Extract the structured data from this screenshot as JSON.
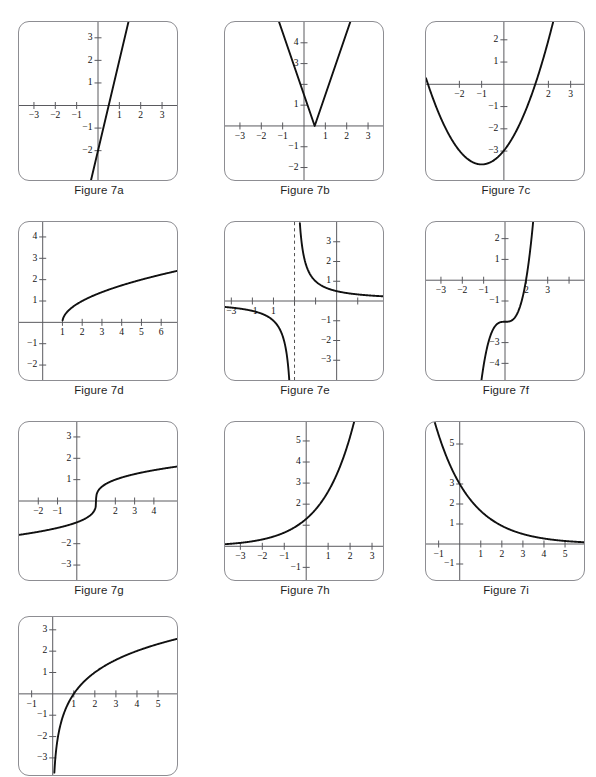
{
  "page": {
    "header_fragment": "",
    "figure_count": 10
  },
  "figures": [
    {
      "id": "7a",
      "caption": "Figure 7a",
      "row": 0,
      "col": 0,
      "chart_data": {
        "type": "line",
        "title": "Figure 7a",
        "xlabel": "",
        "ylabel": "",
        "grid": false,
        "legend": "none",
        "xlim": [
          -3.7,
          3.7
        ],
        "ylim": [
          -3.3,
          3.7
        ],
        "xticks": [
          -3,
          -2,
          -1,
          1,
          2,
          3
        ],
        "yticks": [
          -2,
          -1,
          1,
          2,
          3
        ],
        "xtick_labels": [
          "-3",
          "-2",
          "-1",
          "1",
          "2",
          "3"
        ],
        "ytick_labels": [
          "-2",
          "-1",
          "1",
          "2",
          "3"
        ],
        "description": "Steep increasing straight line, y-intercept -2, x-intercept 0.5",
        "series": [
          {
            "name": "y = 4x - 2",
            "x": [
              -0.35,
              1.45
            ],
            "y": [
              -3.4,
              3.8
            ]
          }
        ]
      }
    },
    {
      "id": "7b",
      "caption": "Figure 7b",
      "row": 0,
      "col": 1,
      "chart_data": {
        "type": "line",
        "title": "Figure 7b",
        "xlabel": "",
        "ylabel": "",
        "grid": false,
        "legend": "none",
        "xlim": [
          -3.7,
          3.7
        ],
        "ylim": [
          -2.6,
          5.0
        ],
        "xticks": [
          -3,
          -2,
          -1,
          1,
          2,
          3
        ],
        "yticks": [
          -2,
          -1,
          1,
          2,
          3,
          4
        ],
        "xtick_labels": [
          "-3",
          "-2",
          "-1",
          "1",
          "2",
          "3"
        ],
        "ytick_labels": [
          "-2",
          "-1",
          "1",
          "3",
          "4"
        ],
        "description": "V-shaped absolute value graph with vertex at (0.5, 0), slopes -3 and +3",
        "series": [
          {
            "name": "y = 3|x - 0.5|",
            "x": [
              -1.25,
              0.5,
              2.25
            ],
            "y": [
              5.25,
              0,
              5.25
            ]
          }
        ]
      }
    },
    {
      "id": "7c",
      "caption": "Figure 7c",
      "row": 0,
      "col": 2,
      "chart_data": {
        "type": "line",
        "title": "Figure 7c",
        "xlabel": "",
        "ylabel": "",
        "grid": false,
        "legend": "none",
        "xlim": [
          -3.5,
          3.6
        ],
        "ylim": [
          -4.3,
          2.8
        ],
        "xticks": [
          -2,
          -1,
          2,
          3
        ],
        "yticks": [
          -3,
          -2,
          -1,
          1,
          2
        ],
        "xtick_labels": [
          "-2",
          "-1",
          "2",
          "3"
        ],
        "ytick_labels": [
          "-3",
          "-2",
          "-1",
          "1",
          "2"
        ],
        "description": "Upward parabola, vertex near (-1, -3.6), y-intercept -3, roots near -2.9 and 0.9",
        "series": [
          {
            "name": "y = 0.6(x + 1)^2 - 3.6",
            "equation": "parabola",
            "vertex": [
              -1,
              -3.6
            ],
            "a": 0.62
          }
        ]
      }
    },
    {
      "id": "7d",
      "caption": "Figure 7d",
      "row": 1,
      "col": 0,
      "chart_data": {
        "type": "line",
        "title": "Figure 7d",
        "xlabel": "",
        "ylabel": "",
        "grid": false,
        "legend": "none",
        "xlim": [
          -1.2,
          6.8
        ],
        "ylim": [
          -2.7,
          4.7
        ],
        "xticks": [
          1,
          2,
          3,
          4,
          5,
          6
        ],
        "yticks": [
          -2,
          -1,
          1,
          2,
          3,
          4
        ],
        "xtick_labels": [
          "1",
          "2",
          "3",
          "4",
          "5",
          "6"
        ],
        "ytick_labels": [
          "-2",
          "-1",
          "1",
          "2",
          "3",
          "4"
        ],
        "description": "Square root curve beginning at (1, 0), rising to about 2.3 at x = 6.4",
        "series": [
          {
            "name": "y = sqrt(x - 1)",
            "equation": "sqrt",
            "x0": 1,
            "k": 1.0
          }
        ]
      }
    },
    {
      "id": "7e",
      "caption": "Figure 7e",
      "row": 1,
      "col": 1,
      "chart_data": {
        "type": "line",
        "title": "Figure 7e",
        "xlabel": "",
        "ylabel": "",
        "grid": false,
        "legend": "none",
        "xlim": [
          -5.3,
          2.2
        ],
        "ylim": [
          -4.0,
          4.0
        ],
        "xticks": [
          -5,
          -4,
          -3,
          -2,
          -1,
          1
        ],
        "yticks": [
          -3,
          -2,
          -1,
          1,
          2,
          3
        ],
        "xtick_labels": [
          "-3",
          "-1",
          "1"
        ],
        "ytick_labels": [
          "-3",
          "-2",
          "-1",
          "1",
          "2",
          "3"
        ],
        "description": "Reciprocal hyperbola with vertical asymptote x = -2 (dashed) and horizontal asymptote y = 0",
        "annotations": [
          {
            "type": "vertical-asymptote",
            "x": -2,
            "style": "dashed"
          }
        ],
        "series": [
          {
            "name": "y = 1/(x + 2)",
            "equation": "reciprocal",
            "asymptote_x": -2
          }
        ]
      }
    },
    {
      "id": "7f",
      "caption": "Figure 7f",
      "row": 1,
      "col": 2,
      "chart_data": {
        "type": "line",
        "title": "Figure 7f",
        "xlabel": "",
        "ylabel": "",
        "grid": false,
        "legend": "none",
        "xlim": [
          -3.7,
          3.7
        ],
        "ylim": [
          -4.8,
          2.8
        ],
        "xticks": [
          -3,
          -2,
          -1,
          1,
          2,
          3
        ],
        "yticks": [
          -4,
          -3,
          -1,
          1,
          2
        ],
        "xtick_labels": [
          "-3",
          "-2",
          "-1",
          "2",
          "3"
        ],
        "ytick_labels": [
          "-4",
          "-3",
          "-1",
          "1",
          "2"
        ],
        "description": "Cubic curve with inflection point near (0, -2), rising steeply, x-intercept near 1",
        "series": [
          {
            "name": "y = 2(x)^3 - 2",
            "equation": "cubic",
            "inflection": [
              0,
              -2
            ],
            "a": 2.1
          }
        ]
      }
    },
    {
      "id": "7g",
      "caption": "Figure 7g",
      "row": 2,
      "col": 0,
      "chart_data": {
        "type": "line",
        "title": "Figure 7g",
        "xlabel": "",
        "ylabel": "",
        "grid": false,
        "legend": "none",
        "xlim": [
          -3.0,
          5.2
        ],
        "ylim": [
          -3.7,
          3.7
        ],
        "xticks": [
          -2,
          -1,
          2,
          3,
          4
        ],
        "yticks": [
          -3,
          -2,
          1,
          2,
          3
        ],
        "xtick_labels": [
          "-2",
          "-1",
          "2",
          "3",
          "4"
        ],
        "ytick_labels": [
          "-3",
          "-2",
          "1",
          "2",
          "3"
        ],
        "description": "Cube root curve with steep center near x = 1, rising slowly at both ends",
        "series": [
          {
            "name": "y = cbrt(x - 1)",
            "equation": "cbrt",
            "x0": 1,
            "k": 1.0
          }
        ]
      }
    },
    {
      "id": "7h",
      "caption": "Figure 7h",
      "row": 2,
      "col": 1,
      "chart_data": {
        "type": "line",
        "title": "Figure 7h",
        "xlabel": "",
        "ylabel": "",
        "grid": false,
        "legend": "none",
        "xlim": [
          -3.7,
          3.5
        ],
        "ylim": [
          -1.6,
          5.9
        ],
        "xticks": [
          -3,
          -2,
          -1,
          1,
          2,
          3
        ],
        "yticks": [
          -1,
          1,
          2,
          3,
          4,
          5
        ],
        "xtick_labels": [
          "-3",
          "-2",
          "-1",
          "1",
          "2",
          "3"
        ],
        "ytick_labels": [
          "-1",
          "2",
          "3",
          "4",
          "5"
        ],
        "description": "Exponential growth curve, horizontal asymptote y = 0, passes through about (0, 1.3)",
        "series": [
          {
            "name": "y = 1.3 * 2^x",
            "equation": "exp-growth",
            "a": 1.3,
            "b": 2.0
          }
        ]
      }
    },
    {
      "id": "7i",
      "caption": "Figure 7i",
      "row": 2,
      "col": 2,
      "chart_data": {
        "type": "line",
        "title": "Figure 7i",
        "xlabel": "",
        "ylabel": "",
        "grid": false,
        "legend": "none",
        "xlim": [
          -1.6,
          5.9
        ],
        "ylim": [
          -1.8,
          6.1
        ],
        "xticks": [
          -1,
          1,
          2,
          3,
          4,
          5
        ],
        "yticks": [
          -1,
          1,
          2,
          3,
          5
        ],
        "xtick_labels": [
          "-1",
          "1",
          "2",
          "3",
          "4",
          "5"
        ],
        "ytick_labels": [
          "-1",
          "1",
          "2",
          "3",
          "5"
        ],
        "description": "Exponential decay curve through (0, 3), approaching y = 0 asymptotically",
        "series": [
          {
            "name": "y = 3 * (0.55)^x",
            "equation": "exp-decay",
            "a": 3.0,
            "b": 0.55
          }
        ]
      }
    },
    {
      "id": "7j",
      "caption": "",
      "row": 3,
      "col": 0,
      "chart_data": {
        "type": "line",
        "title": "Figure 7j",
        "xlabel": "",
        "ylabel": "",
        "grid": false,
        "legend": "none",
        "xlim": [
          -1.6,
          5.9
        ],
        "ylim": [
          -3.8,
          3.6
        ],
        "xticks": [
          -1,
          1,
          2,
          3,
          4,
          5
        ],
        "yticks": [
          -3,
          -2,
          -1,
          1,
          2,
          3
        ],
        "xtick_labels": [
          "-1",
          "1",
          "2",
          "3",
          "4",
          "5"
        ],
        "ytick_labels": [
          "-3",
          "-2",
          "-1",
          "1",
          "2",
          "3"
        ],
        "description": "Logarithmic curve with vertical asymptote x = 0, crossing x-axis at (1, 0)",
        "series": [
          {
            "name": "y = 1.45 * ln(x)",
            "equation": "log",
            "k": 1.45
          }
        ]
      }
    }
  ],
  "colors": {
    "curve": "#111111",
    "axis": "#5a5a5f",
    "panel_border": "#8d8d92",
    "text": "#1f1f1f",
    "background": "#ffffff"
  }
}
